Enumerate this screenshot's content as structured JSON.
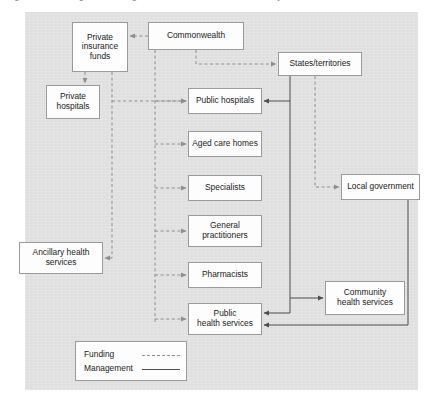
{
  "figure": {
    "caption_partial": "Figure 1: Funding and management of the Australian health system"
  },
  "diagram": {
    "type": "flow-diagram",
    "nodes": [
      {
        "id": "private-insurance-funds",
        "label": "Private\ninsurance\nfunds",
        "x": 72,
        "y": 22,
        "w": 56,
        "h": 50
      },
      {
        "id": "commonwealth",
        "label": "Commonwealth",
        "x": 148,
        "y": 22,
        "w": 96,
        "h": 28
      },
      {
        "id": "states-territories",
        "label": "States/territories",
        "x": 278,
        "y": 52,
        "w": 84,
        "h": 24
      },
      {
        "id": "private-hospitals",
        "label": "Private\nhospitals",
        "x": 46,
        "y": 85,
        "w": 54,
        "h": 34
      },
      {
        "id": "public-hospitals",
        "label": "Public hospitals",
        "x": 188,
        "y": 88,
        "w": 74,
        "h": 26
      },
      {
        "id": "aged-care-homes",
        "label": "Aged care homes",
        "x": 188,
        "y": 131,
        "w": 74,
        "h": 26
      },
      {
        "id": "specialists",
        "label": "Specialists",
        "x": 188,
        "y": 175,
        "w": 74,
        "h": 26
      },
      {
        "id": "general-practitioners",
        "label": "General\npractitioners",
        "x": 188,
        "y": 215,
        "w": 74,
        "h": 32
      },
      {
        "id": "local-government",
        "label": "Local government",
        "x": 341,
        "y": 174,
        "w": 79,
        "h": 26
      },
      {
        "id": "ancillary-health-services",
        "label": "Ancillary health\nservices",
        "x": 19,
        "y": 242,
        "w": 84,
        "h": 32
      },
      {
        "id": "pharmacists",
        "label": "Pharmacists",
        "x": 188,
        "y": 262,
        "w": 74,
        "h": 26
      },
      {
        "id": "community-health-services",
        "label": "Community\nhealth services",
        "x": 325,
        "y": 281,
        "w": 80,
        "h": 34
      },
      {
        "id": "public-health-services",
        "label": "Public\nhealth services",
        "x": 188,
        "y": 303,
        "w": 74,
        "h": 32
      }
    ],
    "edges": [
      {
        "from": "commonwealth",
        "to": "private-insurance-funds",
        "kind": "funding"
      },
      {
        "from": "commonwealth",
        "to": "states-territories",
        "kind": "funding"
      },
      {
        "from": "commonwealth",
        "to": "public-hospitals",
        "kind": "funding"
      },
      {
        "from": "commonwealth",
        "to": "aged-care-homes",
        "kind": "funding"
      },
      {
        "from": "commonwealth",
        "to": "specialists",
        "kind": "funding"
      },
      {
        "from": "commonwealth",
        "to": "general-practitioners",
        "kind": "funding"
      },
      {
        "from": "commonwealth",
        "to": "pharmacists",
        "kind": "funding"
      },
      {
        "from": "commonwealth",
        "to": "public-health-services",
        "kind": "funding"
      },
      {
        "from": "private-insurance-funds",
        "to": "private-hospitals",
        "kind": "funding"
      },
      {
        "from": "private-insurance-funds",
        "to": "public-hospitals",
        "kind": "funding"
      },
      {
        "from": "private-insurance-funds",
        "to": "ancillary-health-services",
        "kind": "funding"
      },
      {
        "from": "states-territories",
        "to": "local-government",
        "kind": "funding"
      },
      {
        "from": "states-territories",
        "to": "public-hospitals",
        "kind": "management"
      },
      {
        "from": "states-territories",
        "to": "community-health-services",
        "kind": "management"
      },
      {
        "from": "states-territories",
        "to": "public-health-services",
        "kind": "management"
      },
      {
        "from": "local-government",
        "to": "public-health-services",
        "kind": "management"
      }
    ]
  },
  "legend": {
    "title": "",
    "items": [
      {
        "label": "Funding",
        "style": "dashed"
      },
      {
        "label": "Management",
        "style": "solid"
      }
    ]
  },
  "colors": {
    "panel_background": "#dfdfdf",
    "node_fill": "#fdfdfd",
    "node_border": "#9a9a9a",
    "funding_line": "#8e8e8e",
    "management_line": "#4d4d4d",
    "text": "#1b1b1b"
  }
}
